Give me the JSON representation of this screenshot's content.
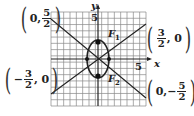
{
  "figure": {
    "grid": {
      "x0": 51,
      "y0": 12,
      "x1": 146,
      "y1": 106,
      "cols": 15,
      "rows": 15,
      "color": "#777777"
    },
    "axes": {
      "origin_px": [
        98,
        59
      ],
      "x_label": "x",
      "y_label": "y",
      "tick_label_y": "5",
      "tick_label_x": "5"
    },
    "ellipse": {
      "cx": 98,
      "cy": 59,
      "rx": 11,
      "ry": 19,
      "color": "#222222"
    },
    "foci": [
      {
        "name": "F1",
        "label": "F",
        "sub": "1",
        "px": [
          98,
          44
        ]
      },
      {
        "name": "F2",
        "label": "F",
        "sub": "2",
        "px": [
          98,
          74
        ]
      }
    ],
    "vertices_px": [
      [
        87,
        59
      ],
      [
        109,
        59
      ]
    ],
    "lines": [
      {
        "from_px": [
          51,
          22
        ],
        "to_px": [
          146,
          97
        ],
        "desc": "line through (0,5/2) and (0,-5/2) side"
      },
      {
        "from_px": [
          51,
          92
        ],
        "to_px": [
          146,
          26
        ],
        "desc": "line through (-3/2,0) and (3/2,0) side"
      }
    ],
    "labels": {
      "top_left": {
        "pre": "0,",
        "num": "5",
        "den": "2",
        "neg": ""
      },
      "right": {
        "num": "3",
        "den": "2",
        "post": ", 0",
        "neg": ""
      },
      "left": {
        "neg": "−",
        "num": "3",
        "den": "2",
        "post": ", 0"
      },
      "bottom_right": {
        "pre": "0,",
        "neg": "−",
        "num": "5",
        "den": "2"
      }
    }
  }
}
